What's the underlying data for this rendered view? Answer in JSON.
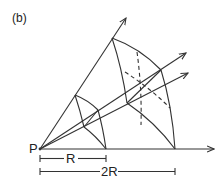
{
  "figure": {
    "panel_label": "(b)",
    "origin_label": "P",
    "scale_labels": {
      "near": "R",
      "far": "2R"
    },
    "colors": {
      "line": "#333333",
      "background": "#ffffff"
    }
  }
}
